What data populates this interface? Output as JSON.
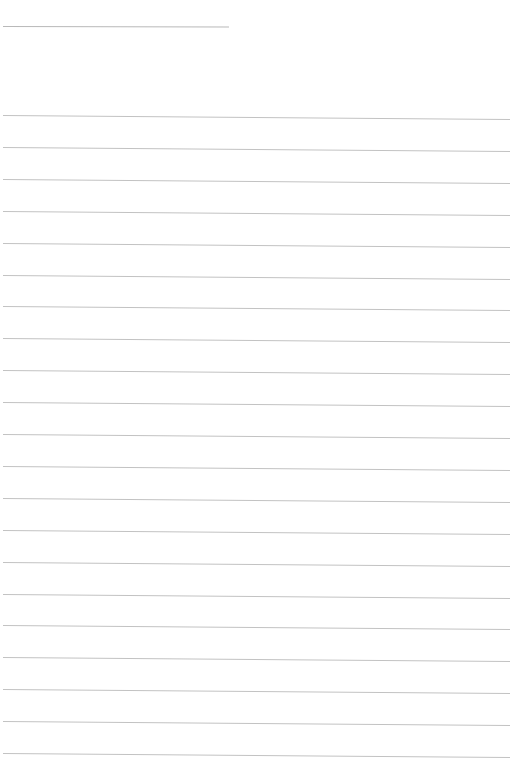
{
  "page": {
    "type": "blank lined paper",
    "header_line": {
      "present": true
    },
    "rules": {
      "count": 21,
      "color": "#c2c2c2"
    },
    "background_color": "#ffffff"
  }
}
